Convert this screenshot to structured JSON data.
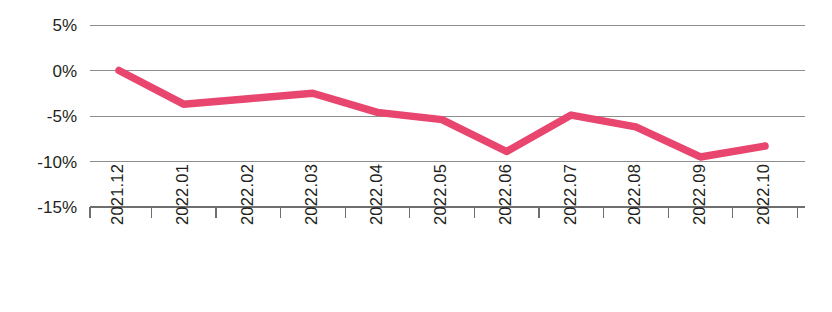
{
  "chart_data": {
    "type": "line",
    "title": "",
    "subtitle": "",
    "xlabel": "",
    "ylabel": "",
    "categories": [
      "2021.12",
      "2022.01",
      "2022.02",
      "2022.03",
      "2022.04",
      "2022.05",
      "2022.06",
      "2022.07",
      "2022.08",
      "2022.09",
      "2022.10"
    ],
    "series": [
      {
        "name": "",
        "values": [
          0.0,
          -3.7,
          -3.1,
          -2.5,
          -4.6,
          -5.4,
          -8.9,
          -4.9,
          -6.2,
          -9.5,
          -8.3
        ],
        "color": "#E8456F"
      }
    ],
    "ylim": [
      -15,
      5
    ],
    "ytick_labels": [
      "5%",
      "0%",
      "-5%",
      "-10%",
      "-15%"
    ],
    "ytick_values": [
      5,
      0,
      -5,
      -10,
      -15
    ],
    "grid": true,
    "grid_axis": "y",
    "legend": "none",
    "xtick_label_rotation": -90,
    "axis_color": "#6e6e6e",
    "gridline_color": "#8d8d8d",
    "background_color": "#ffffff"
  }
}
